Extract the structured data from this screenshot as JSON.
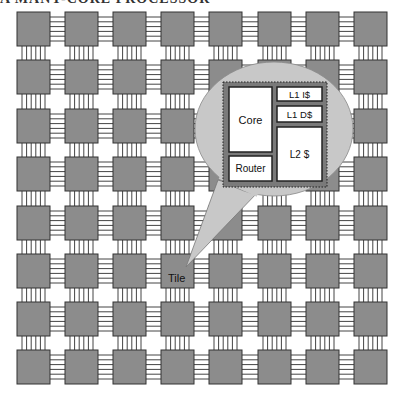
{
  "header": {
    "cut_title": "A MANY-CORE PROCESSOR"
  },
  "grid": {
    "rows": 8,
    "cols": 8,
    "tile_fill": "#8c8c8c",
    "tile_stroke": "#333333",
    "link_color": "#444444"
  },
  "callout": {
    "pointer_label": "Tile",
    "bubble_fill": "#c8c8c8",
    "tile_box_fill": "#7a7a7a",
    "blocks": {
      "core": "Core",
      "router": "Router",
      "l1i": "L1 I$",
      "l1d": "L1 D$",
      "l2": "L2 $"
    }
  }
}
